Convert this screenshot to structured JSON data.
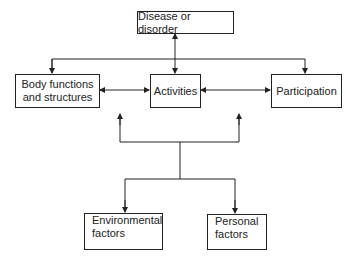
{
  "diagram": {
    "nodes": {
      "disease": {
        "label": "Disease or disorder"
      },
      "body": {
        "line1": "Body functions",
        "line2": "and structures"
      },
      "activities": {
        "label": "Activities"
      },
      "participation": {
        "label": "Participation"
      },
      "environmental": {
        "line1": "Environmental",
        "line2": "factors"
      },
      "personal": {
        "line1": "Personal",
        "line2": "factors"
      }
    },
    "edges": [
      {
        "from": "disease",
        "to": "activities",
        "type": "bidirectional"
      },
      {
        "from": "disease",
        "to": "body",
        "type": "arrow"
      },
      {
        "from": "disease",
        "to": "participation",
        "type": "arrow"
      },
      {
        "from": "body",
        "to": "activities",
        "type": "bidirectional"
      },
      {
        "from": "activities",
        "to": "participation",
        "type": "bidirectional"
      },
      {
        "from": "contextual-junction",
        "to": "environmental",
        "type": "arrow"
      },
      {
        "from": "contextual-junction",
        "to": "personal",
        "type": "arrow"
      },
      {
        "from": "contextual-junction",
        "to": "activities-row",
        "type": "arrow"
      }
    ],
    "colors": {
      "line": "#222222",
      "background": "#ffffff"
    }
  }
}
